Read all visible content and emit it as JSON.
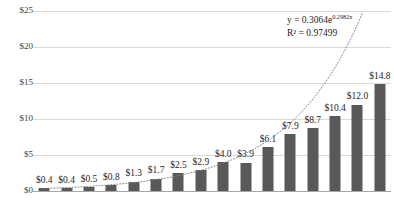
{
  "chart_data": {
    "type": "bar",
    "title": "",
    "xlabel": "",
    "ylabel": "",
    "ylim": [
      0,
      25
    ],
    "grid": true,
    "legend": false,
    "categories": [
      "1",
      "2",
      "3",
      "4",
      "5",
      "6",
      "7",
      "8",
      "9",
      "10",
      "11",
      "12",
      "13",
      "14",
      "15",
      "16"
    ],
    "values": [
      0.4,
      0.4,
      0.5,
      0.8,
      1.3,
      1.7,
      2.5,
      2.9,
      4.0,
      3.9,
      6.1,
      7.9,
      8.7,
      10.4,
      12.0,
      14.8
    ],
    "data_labels": [
      "$0.4",
      "$0.4",
      "$0.5",
      "$0.8",
      "$1.3",
      "$1.7",
      "$2.5",
      "$2.9",
      "$4.0",
      "$3.9",
      "$6.1",
      "$7.9",
      "$8.7",
      "$10.4",
      "$12.0",
      "$14.8"
    ],
    "ytick_values": [
      0,
      5,
      10,
      15,
      20,
      25
    ],
    "ytick_labels": [
      "$0",
      "$5",
      "$10",
      "$15",
      "$20",
      "$25"
    ],
    "series_color": "#595959",
    "gridline_color": "#d9d9d9",
    "axis_color": "#a6a6a6",
    "trendline": {
      "type": "exponential",
      "coefficient": 0.3064,
      "exponent": 0.2982,
      "r_squared": 0.97499,
      "style": "dotted",
      "color": "#7f7f7f"
    },
    "annotations": {
      "equation_prefix": "y = 0.3064e",
      "equation_exponent": "0.2982x",
      "r_squared_label": "R² = 0.97499"
    }
  }
}
